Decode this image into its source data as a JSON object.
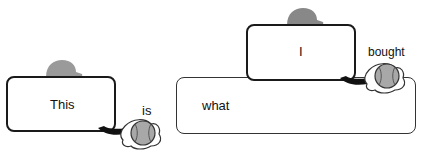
{
  "diagram": {
    "words": {
      "this": "This",
      "is": "is",
      "i": "I",
      "what": "what",
      "bought": "bought"
    },
    "colors": {
      "border": "#1a1a1a",
      "cap": "#9a9a9a",
      "ball": "#a8a8a8",
      "glove": "#ffffff",
      "arm": "#111111"
    }
  }
}
